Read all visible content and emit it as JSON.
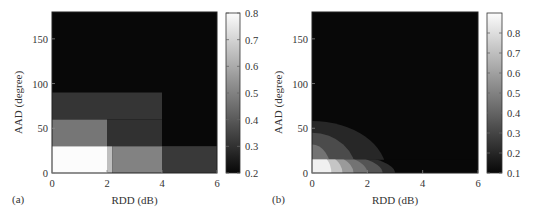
{
  "chart_data": [
    {
      "type": "heatmap",
      "panel_label": "(a)",
      "title": "",
      "xlabel": "RDD (dB)",
      "ylabel": "AAD (degree)",
      "xlim": [
        0,
        6
      ],
      "ylim": [
        0,
        180
      ],
      "xticks": [
        0,
        2,
        4,
        6
      ],
      "yticks": [
        0,
        50,
        100,
        150
      ],
      "grid": false,
      "colormap": "gray",
      "colorbar": {
        "range": [
          0.2,
          0.8
        ],
        "ticks": [
          0.2,
          0.3,
          0.4,
          0.5,
          0.6,
          0.7,
          0.8
        ]
      },
      "background_value": 0.2,
      "regions": [
        {
          "x": [
            0,
            2
          ],
          "y": [
            0,
            30
          ],
          "value": 0.8
        },
        {
          "x": [
            2,
            2.2
          ],
          "y": [
            0,
            30
          ],
          "value": 0.65
        },
        {
          "x": [
            2.2,
            4
          ],
          "y": [
            0,
            30
          ],
          "value": 0.5
        },
        {
          "x": [
            4,
            6
          ],
          "y": [
            0,
            30
          ],
          "value": 0.32
        },
        {
          "x": [
            0,
            2
          ],
          "y": [
            30,
            60
          ],
          "value": 0.47
        },
        {
          "x": [
            2,
            4
          ],
          "y": [
            30,
            60
          ],
          "value": 0.3
        },
        {
          "x": [
            0,
            4
          ],
          "y": [
            60,
            90
          ],
          "value": 0.31
        }
      ]
    },
    {
      "type": "heatmap",
      "panel_label": "(b)",
      "title": "",
      "xlabel": "RDD (dB)",
      "ylabel": "AAD (degree)",
      "xlim": [
        0,
        6
      ],
      "ylim": [
        0,
        180
      ],
      "xticks": [
        0,
        2,
        4,
        6
      ],
      "yticks": [
        0,
        50,
        100,
        150
      ],
      "grid": false,
      "colormap": "gray",
      "colorbar": {
        "range": [
          0.1,
          0.9
        ],
        "ticks": [
          0.1,
          0.2,
          0.3,
          0.4,
          0.5,
          0.6,
          0.7,
          0.8
        ]
      },
      "background_value": 0.1,
      "upper_contours": [
        {
          "rx": 2.7,
          "ry": 58,
          "value": 0.2
        },
        {
          "rx": 1.6,
          "ry": 45,
          "value": 0.32
        },
        {
          "rx": 0.7,
          "ry": 32,
          "value": 0.45
        }
      ],
      "bottom_strip": {
        "y": [
          0,
          15
        ],
        "bands": [
          {
            "rx": 3.0,
            "value": 0.22
          },
          {
            "rx": 2.55,
            "value": 0.35
          },
          {
            "rx": 2.0,
            "value": 0.45
          },
          {
            "rx": 1.5,
            "value": 0.58
          },
          {
            "rx": 1.1,
            "value": 0.72
          },
          {
            "rx": 0.7,
            "value": 0.86
          }
        ]
      }
    }
  ]
}
